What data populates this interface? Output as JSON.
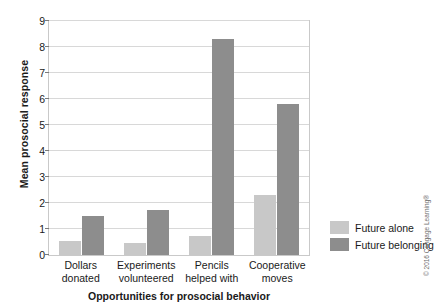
{
  "chart_data": {
    "type": "bar",
    "title": "",
    "xlabel": "Opportunities for prosocial behavior",
    "ylabel": "Mean prosocial response",
    "categories": [
      "Dollars\ndonated",
      "Experiments\nvolunteered",
      "Pencils\nhelped with",
      "Cooperative\nmoves"
    ],
    "category_lines": [
      [
        "Dollars",
        "donated"
      ],
      [
        "Experiments",
        "volunteered"
      ],
      [
        "Pencils",
        "helped with"
      ],
      [
        "Cooperative",
        "moves"
      ]
    ],
    "series": [
      {
        "name": "Future alone",
        "color": "#c8c8c8",
        "values": [
          0.55,
          0.45,
          0.75,
          2.3
        ]
      },
      {
        "name": "Future belonging",
        "color": "#8d8d8d",
        "values": [
          1.5,
          1.75,
          8.3,
          5.8
        ]
      }
    ],
    "ylim": [
      0,
      9
    ],
    "yticks": [
      0,
      1,
      2,
      3,
      4,
      5,
      6,
      7,
      8,
      9
    ],
    "grid": true,
    "legend_position": "right"
  },
  "legend": {
    "entries": [
      {
        "label": "Future alone"
      },
      {
        "label": "Future belonging"
      }
    ]
  },
  "footer": {
    "copyright": "© 2016 Cengage Learning®"
  }
}
